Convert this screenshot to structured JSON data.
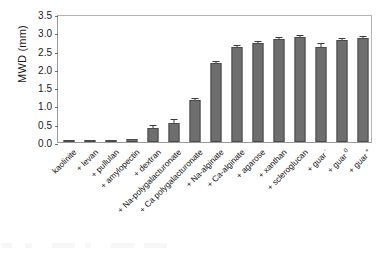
{
  "chart_data": {
    "type": "bar",
    "title": "",
    "subtitle": "",
    "xlabel": "",
    "ylabel": "MWD (mm)",
    "ylim": [
      0.0,
      3.5
    ],
    "yticks": [
      "0.0",
      "0.5",
      "1.0",
      "1.5",
      "2.0",
      "2.5",
      "3.0",
      "3.5"
    ],
    "ytick_values": [
      0.0,
      0.5,
      1.0,
      1.5,
      2.0,
      2.5,
      3.0,
      3.5
    ],
    "grid": false,
    "legend": "none",
    "bar_color": "#6e6e6e",
    "bar_edge_color": "#4a4a4a",
    "error_bar_color": "#3a3a3a",
    "frame_color": "#9a9a9a",
    "categories": [
      "kaolinite",
      "+ levan",
      "+ pullulan",
      "+ amylopectin",
      "+ dextran",
      "+ Na-polygalacturonate",
      "+ Ca polygalacturonate",
      "+ Na-alginate",
      "+ Ca-alginate",
      "+ agarose",
      "+ xanthan",
      "+ scleroglucan",
      "+ guar -",
      "+ guar 0",
      "+ guar +"
    ],
    "category_sup": [
      "",
      "",
      "",
      "",
      "",
      "",
      "",
      "",
      "",
      "",
      "",
      "",
      "-",
      "0",
      "+"
    ],
    "category_base": [
      "kaolinite",
      "+ levan",
      "+ pullulan",
      "+ amylopectin",
      "+ dextran",
      "+ Na-polygalacturonate",
      "+ Ca polygalacturonate",
      "+ Na-alginate",
      "+ Ca-alginate",
      "+ agarose",
      "+ xanthan",
      "+ scleroglucan",
      "+ guar",
      "+ guar",
      "+ guar"
    ],
    "values": [
      0.05,
      0.03,
      0.04,
      0.08,
      0.37,
      0.52,
      1.14,
      2.17,
      2.61,
      2.71,
      2.81,
      2.87,
      2.6,
      2.78,
      2.84
    ],
    "errors": [
      0.02,
      0.01,
      0.01,
      0.01,
      0.08,
      0.07,
      0.03,
      0.03,
      0.02,
      0.02,
      0.02,
      0.02,
      0.07,
      0.02,
      0.02
    ]
  }
}
